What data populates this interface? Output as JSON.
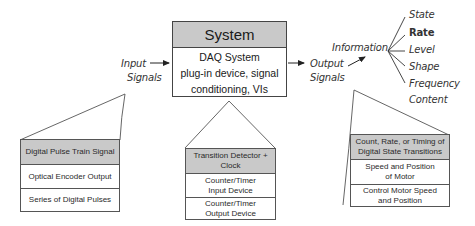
{
  "system": {
    "title": "System",
    "body_lines": [
      "DAQ System",
      "plug-in device, signal",
      "conditioning, VIs"
    ]
  },
  "input": {
    "lines": [
      "Input",
      "Signals"
    ]
  },
  "output": {
    "lines": [
      "Output",
      "Signals"
    ]
  },
  "information": {
    "label": "Information",
    "items": [
      "State",
      "Rate",
      "Level",
      "Shape",
      "Frequency",
      "Content"
    ],
    "highlighted": "Rate"
  },
  "callouts": {
    "input": {
      "rows": [
        "Digital Pulse Train Signal",
        "Optical Encoder Output",
        "Series of Digital Pulses"
      ]
    },
    "system": {
      "rows": [
        "Transition Detector + Clock",
        "Counter/Timer Input Device",
        "Counter/Timer Output Device"
      ]
    },
    "output": {
      "rows": [
        "Count, Rate, or Timing of Digital State Transitions",
        "Speed and Position of Motor",
        "Control Motor Speed and Position"
      ]
    }
  },
  "colors": {
    "header_fill": "#c9c9c9",
    "line": "#444444"
  }
}
